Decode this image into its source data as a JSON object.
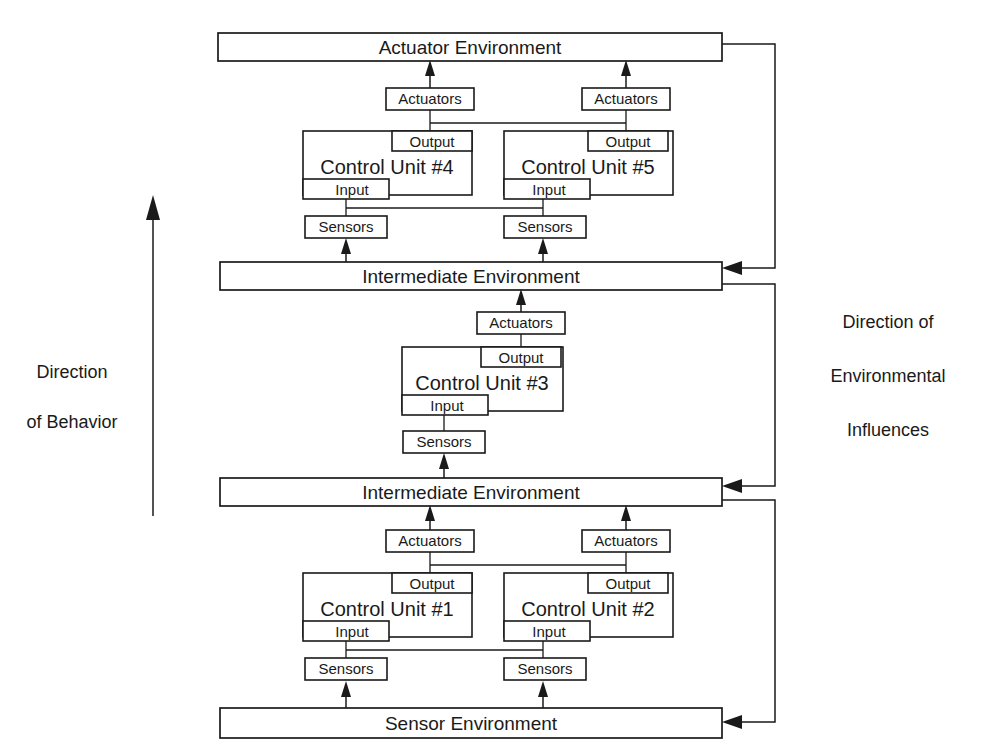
{
  "diagram": {
    "colors": {
      "stroke": "#1a1a1a",
      "fill": "#ffffff",
      "background": "#ffffff"
    },
    "environments": [
      {
        "id": "actuator-environment",
        "label": "Actuator Environment"
      },
      {
        "id": "intermediate-environment-upper",
        "label": "Intermediate Environment"
      },
      {
        "id": "intermediate-environment-lower",
        "label": "Intermediate Environment"
      },
      {
        "id": "sensor-environment",
        "label": "Sensor Environment"
      }
    ],
    "control_units": [
      {
        "id": "control-unit-4",
        "label": "Control Unit #4",
        "output_label": "Output",
        "input_label": "Input",
        "actuators_label": "Actuators",
        "sensors_label": "Sensors"
      },
      {
        "id": "control-unit-5",
        "label": "Control Unit #5",
        "output_label": "Output",
        "input_label": "Input",
        "actuators_label": "Actuators",
        "sensors_label": "Sensors"
      },
      {
        "id": "control-unit-3",
        "label": "Control Unit #3",
        "output_label": "Output",
        "input_label": "Input",
        "actuators_label": "Actuators",
        "sensors_label": "Sensors"
      },
      {
        "id": "control-unit-1",
        "label": "Control Unit #1",
        "output_label": "Output",
        "input_label": "Input",
        "actuators_label": "Actuators",
        "sensors_label": "Sensors"
      },
      {
        "id": "control-unit-2",
        "label": "Control Unit #2",
        "output_label": "Output",
        "input_label": "Input",
        "actuators_label": "Actuators",
        "sensors_label": "Sensors"
      }
    ],
    "annotations": {
      "left": {
        "line1": "Direction",
        "line2": "of Behavior",
        "arrow": "up-arrow-icon"
      },
      "right": {
        "line1": "Direction of",
        "line2": "Environmental",
        "line3": "Influences"
      }
    }
  }
}
